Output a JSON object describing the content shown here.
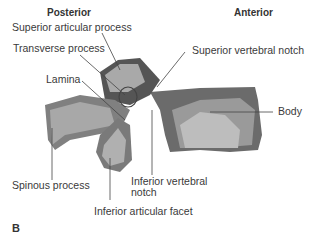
{
  "figure": {
    "panel_letter": "B",
    "orientation": {
      "left": "Posterior",
      "right": "Anterior"
    },
    "labels": {
      "superior_articular_process": "Superior articular process",
      "transverse_process": "Transverse process",
      "lamina": "Lamina",
      "superior_vertebral_notch": "Superior vertebral notch",
      "body": "Body",
      "spinous_process": "Spinous process",
      "inferior_vertebral_notch_1": "Inferior vertebral",
      "inferior_vertebral_notch_2": "notch",
      "inferior_articular_facet": "Inferior articular facet"
    }
  }
}
